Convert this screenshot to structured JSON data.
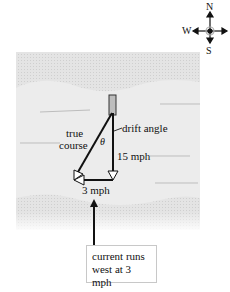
{
  "compass": {
    "north": "N",
    "south": "S",
    "west": "W"
  },
  "labels": {
    "true_course_line1": "true",
    "true_course_line2": "course",
    "theta": "θ",
    "drift_angle": "drift angle",
    "boat_speed": "15 mph",
    "current_speed": "3 mph"
  },
  "callout": {
    "line1": "current runs",
    "line2": "west at 3 mph"
  },
  "colors": {
    "water_light": "#e6e6e6",
    "water_dark": "#d2d2d2",
    "vector": "#111111"
  }
}
